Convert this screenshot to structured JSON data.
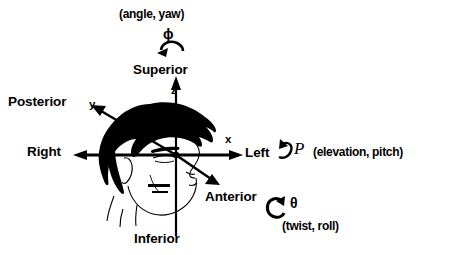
{
  "figure": {
    "background_color": "#ffffff",
    "ink_color": "#000000"
  },
  "axes": {
    "x": {
      "tick_label": "x",
      "positive_label": "Left",
      "negative_label": "Right"
    },
    "y": {
      "tick_label": "y",
      "positive_label": "Posterior",
      "negative_label": "Anterior"
    },
    "z": {
      "tick_label": "z",
      "positive_label": "Superior",
      "negative_label": "Inferior"
    }
  },
  "rotations": {
    "yaw": {
      "symbol": "ϕ",
      "caption": "(angle, yaw)",
      "arrow": "curved-arrow-counterclockwise"
    },
    "pitch": {
      "symbol": "P",
      "caption": "(elevation, pitch)",
      "arrow": "hooked-curved-arrow"
    },
    "roll": {
      "symbol": "θ",
      "caption": "(twist, roll)",
      "arrow": "circular-arrow-clockwise"
    }
  },
  "subject": {
    "illustration": "head-profile-drawing"
  }
}
